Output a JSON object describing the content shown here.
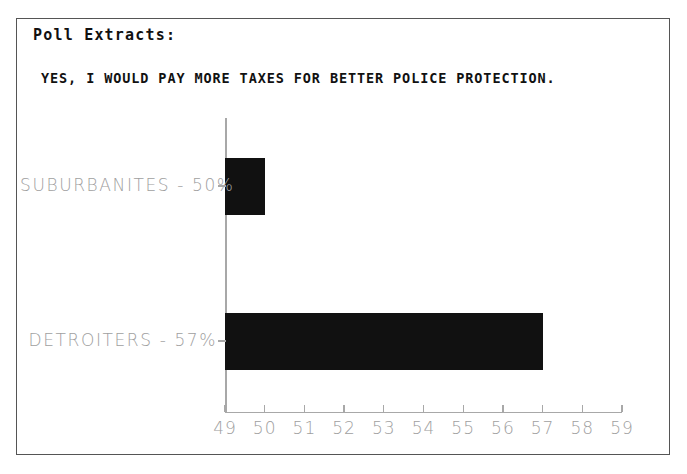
{
  "frame": {
    "title": "Poll Extracts:",
    "subtitle": "YES, I WOULD PAY MORE TAXES FOR BETTER POLICE PROTECTION."
  },
  "chart_data": {
    "type": "bar",
    "orientation": "horizontal",
    "title": "YES, I WOULD PAY MORE TAXES FOR BETTER POLICE PROTECTION.",
    "subtitle": "Poll Extracts:",
    "xlabel": "",
    "ylabel": "",
    "categories": [
      "SUBURBANITES",
      "DETROITERS"
    ],
    "values": [
      50,
      57
    ],
    "value_unit": "%",
    "category_labels": [
      "SUBURBANITES - 50%",
      "DETROITERS - 57%"
    ],
    "xlim": [
      49,
      59
    ],
    "xticks": [
      49,
      50,
      51,
      52,
      53,
      54,
      55,
      56,
      57,
      58,
      59
    ],
    "xtick_labels": [
      "49",
      "50",
      "51",
      "52",
      "53",
      "54",
      "55",
      "56",
      "57",
      "58",
      "59"
    ],
    "grid": false,
    "legend": false,
    "bar_color": "#111111",
    "axis_color": "#a8a8a8",
    "label_color": "#a0a0a0",
    "series": [
      {
        "name": "SUBURBANITES",
        "label": "SUBURBANITES - 50%",
        "value": 50
      },
      {
        "name": "DETROITERS",
        "label": "DETROITERS - 57%",
        "value": 57
      }
    ]
  }
}
